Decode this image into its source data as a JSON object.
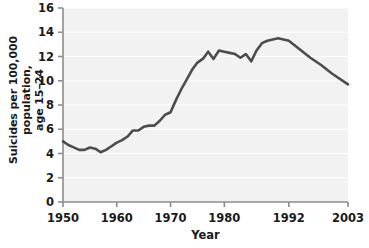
{
  "chart_data": {
    "type": "line",
    "title": "",
    "xlabel": "Year",
    "ylabel_line1": "Suicides per 100,000 population,",
    "ylabel_line2": "age 15–24",
    "ylabel": "Suicides per 100,000 population, age 15–24",
    "grid": true,
    "legend": "none",
    "xlim": [
      1950,
      2003
    ],
    "ylim": [
      0,
      16
    ],
    "xticks": [
      1950,
      1960,
      1970,
      1980,
      1992,
      2003
    ],
    "xtick_labels": [
      "1950",
      "1960",
      "1970",
      "1980",
      "1992",
      "2003"
    ],
    "yticks": [
      0,
      2,
      4,
      6,
      8,
      10,
      12,
      14,
      16
    ],
    "ytick_labels": [
      "0",
      "2",
      "4",
      "6",
      "8",
      "10",
      "12",
      "14",
      "16"
    ],
    "line_color": "#4d4d4d",
    "plot_background": "#f2f2f2",
    "axis_color": "#8c8c8c",
    "series": [
      {
        "name": "Suicide rate, age 15-24",
        "x": [
          1950,
          1951,
          1952,
          1953,
          1954,
          1955,
          1956,
          1957,
          1958,
          1959,
          1960,
          1961,
          1962,
          1963,
          1964,
          1965,
          1966,
          1967,
          1968,
          1969,
          1970,
          1971,
          1972,
          1973,
          1974,
          1975,
          1976,
          1977,
          1978,
          1979,
          1980,
          1981,
          1982,
          1983,
          1984,
          1985,
          1986,
          1987,
          1988,
          1989,
          1990,
          1991,
          1992,
          1994,
          1996,
          1998,
          2000,
          2003
        ],
        "values": [
          5.0,
          4.7,
          4.5,
          4.3,
          4.3,
          4.5,
          4.4,
          4.1,
          4.3,
          4.6,
          4.9,
          5.1,
          5.4,
          5.9,
          5.9,
          6.2,
          6.3,
          6.3,
          6.7,
          7.2,
          7.4,
          8.4,
          9.3,
          10.1,
          10.9,
          11.5,
          11.8,
          12.4,
          11.8,
          12.5,
          12.4,
          12.3,
          12.2,
          11.9,
          12.2,
          11.6,
          12.5,
          13.1,
          13.3,
          13.4,
          13.5,
          13.4,
          13.3,
          12.6,
          11.9,
          11.3,
          10.6,
          9.7
        ]
      }
    ]
  }
}
